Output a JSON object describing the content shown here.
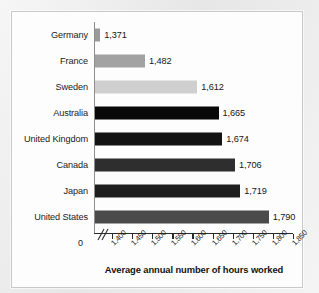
{
  "chart_data": {
    "type": "bar",
    "orientation": "horizontal",
    "title": "",
    "xlabel": "Average annual number of hours worked",
    "ylabel": "",
    "xlim": [
      1360,
      1850
    ],
    "axis_break": true,
    "axis_break_marker": "//",
    "zero_tick_label": "0",
    "grid": false,
    "legend": null,
    "xticks": [
      "1,400",
      "1,450",
      "1,500",
      "1,550",
      "1,600",
      "1,650",
      "1,700",
      "1,750",
      "1,800",
      "1,850"
    ],
    "xtick_values": [
      1400,
      1450,
      1500,
      1550,
      1600,
      1650,
      1700,
      1750,
      1800,
      1850
    ],
    "categories": [
      "Germany",
      "France",
      "Sweden",
      "Australia",
      "United Kingdom",
      "Canada",
      "Japan",
      "United States"
    ],
    "values": [
      1371,
      1482,
      1612,
      1665,
      1674,
      1706,
      1719,
      1790
    ],
    "value_labels": [
      "1,371",
      "1,482",
      "1,612",
      "1,665",
      "1,674",
      "1,706",
      "1,719",
      "1,790"
    ],
    "bar_colors": [
      "#9b9b9b",
      "#a2a2a2",
      "#cfcfcf",
      "#090909",
      "#131313",
      "#2e2e2e",
      "#1e1e1e",
      "#4a4a4a"
    ]
  },
  "colors": {
    "panel_background": "#fdfdfd",
    "page_background": "#ebebec",
    "panel_border": "#c9c9c9",
    "axis_line": "#2b2b2b",
    "category_axis_line": "#8e8e8e",
    "text": "#1b1b1b"
  }
}
